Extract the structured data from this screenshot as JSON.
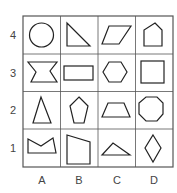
{
  "grid": {
    "rows": [
      "4",
      "3",
      "2",
      "1"
    ],
    "columns": [
      "A",
      "B",
      "C",
      "D"
    ],
    "line_color": "#555555",
    "shape_color": "#222222",
    "cells": [
      {
        "row": "4",
        "col": "A",
        "shape": "circle"
      },
      {
        "row": "4",
        "col": "B",
        "shape": "right-triangle"
      },
      {
        "row": "4",
        "col": "C",
        "shape": "parallelogram"
      },
      {
        "row": "4",
        "col": "D",
        "shape": "pentagon-house"
      },
      {
        "row": "3",
        "col": "A",
        "shape": "hourglass-concave"
      },
      {
        "row": "3",
        "col": "B",
        "shape": "rectangle"
      },
      {
        "row": "3",
        "col": "C",
        "shape": "hexagon"
      },
      {
        "row": "3",
        "col": "D",
        "shape": "square"
      },
      {
        "row": "2",
        "col": "A",
        "shape": "isosceles-triangle"
      },
      {
        "row": "2",
        "col": "B",
        "shape": "pentagon"
      },
      {
        "row": "2",
        "col": "C",
        "shape": "trapezoid"
      },
      {
        "row": "2",
        "col": "D",
        "shape": "octagon"
      },
      {
        "row": "1",
        "col": "A",
        "shape": "concave-crown"
      },
      {
        "row": "1",
        "col": "B",
        "shape": "irregular-quadrilateral"
      },
      {
        "row": "1",
        "col": "C",
        "shape": "obtuse-triangle"
      },
      {
        "row": "1",
        "col": "D",
        "shape": "rhombus"
      }
    ]
  }
}
